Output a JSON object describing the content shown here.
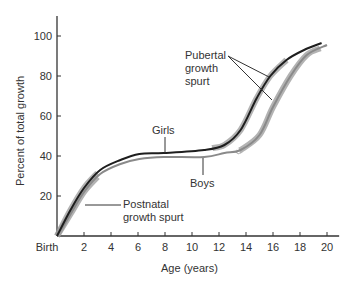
{
  "chart_data": {
    "type": "line",
    "title": "",
    "xlabel": "Age (years)",
    "ylabel": "Percent of total growth",
    "xlim": [
      0,
      20
    ],
    "ylim": [
      0,
      110
    ],
    "grid": false,
    "legend": "none (curves labeled directly)",
    "x_ticks": [
      {
        "value": 0,
        "label": "Birth"
      },
      {
        "value": 2,
        "label": "2"
      },
      {
        "value": 4,
        "label": "4"
      },
      {
        "value": 6,
        "label": "6"
      },
      {
        "value": 8,
        "label": "8"
      },
      {
        "value": 10,
        "label": "10"
      },
      {
        "value": 12,
        "label": "12"
      },
      {
        "value": 14,
        "label": "14"
      },
      {
        "value": 16,
        "label": "16"
      },
      {
        "value": 18,
        "label": "18"
      },
      {
        "value": 20,
        "label": "20"
      }
    ],
    "y_ticks": [
      {
        "value": 20,
        "label": "20"
      },
      {
        "value": 40,
        "label": "40"
      },
      {
        "value": 60,
        "label": "60"
      },
      {
        "value": 80,
        "label": "80"
      },
      {
        "value": 100,
        "label": "100"
      }
    ],
    "series": [
      {
        "name": "Girls",
        "color": "#222222",
        "points": [
          [
            0,
            0
          ],
          [
            1,
            13
          ],
          [
            2,
            24
          ],
          [
            3.2,
            33
          ],
          [
            4.7,
            38
          ],
          [
            6.1,
            41
          ],
          [
            7.9,
            41.5
          ],
          [
            10.9,
            43
          ],
          [
            12.4,
            45.5
          ],
          [
            13.6,
            53
          ],
          [
            14.8,
            69
          ],
          [
            15.8,
            80
          ],
          [
            17,
            88
          ],
          [
            18.3,
            93
          ],
          [
            19.6,
            96.5
          ]
        ]
      },
      {
        "name": "Boys",
        "color": "#888888",
        "points": [
          [
            0,
            0
          ],
          [
            1,
            11
          ],
          [
            2,
            22
          ],
          [
            3.2,
            31
          ],
          [
            4.7,
            36
          ],
          [
            6.1,
            38.5
          ],
          [
            7.9,
            39.5
          ],
          [
            10.9,
            39.5
          ],
          [
            12.4,
            41.5
          ],
          [
            13.6,
            43
          ],
          [
            15,
            50.5
          ],
          [
            16,
            64.5
          ],
          [
            17.3,
            80
          ],
          [
            18.5,
            90.5
          ],
          [
            20,
            95.5
          ]
        ]
      }
    ],
    "highlighted_segments": [
      {
        "series": "Girls",
        "label": "Postnatal growth spurt",
        "x_range": [
          0,
          3
        ]
      },
      {
        "series": "Boys",
        "label": "Postnatal growth spurt",
        "x_range": [
          0,
          3
        ]
      },
      {
        "series": "Girls",
        "label": "Pubertal growth spurt",
        "x_range": [
          11.5,
          17
        ]
      },
      {
        "series": "Boys",
        "label": "Pubertal growth spurt",
        "x_range": [
          13.5,
          19.5
        ]
      }
    ],
    "annotations": [
      {
        "text": "Girls",
        "target": "Girls curve",
        "at_x": 8
      },
      {
        "text": "Boys",
        "target": "Boys curve",
        "at_x": 10.8
      },
      {
        "text": "Pubertal growth spurt",
        "target": "both curves near age 15"
      },
      {
        "text": "Postnatal growth spurt",
        "target": "early curves near age 1.5"
      }
    ]
  },
  "labels": {
    "ylabel": "Percent of total growth",
    "xlabel": "Age (years)",
    "girls": "Girls",
    "boys": "Boys",
    "pubertal_1": "Pubertal",
    "pubertal_2": "growth",
    "pubertal_3": "spurt",
    "postnatal_1": "Postnatal",
    "postnatal_2": "growth spurt"
  }
}
